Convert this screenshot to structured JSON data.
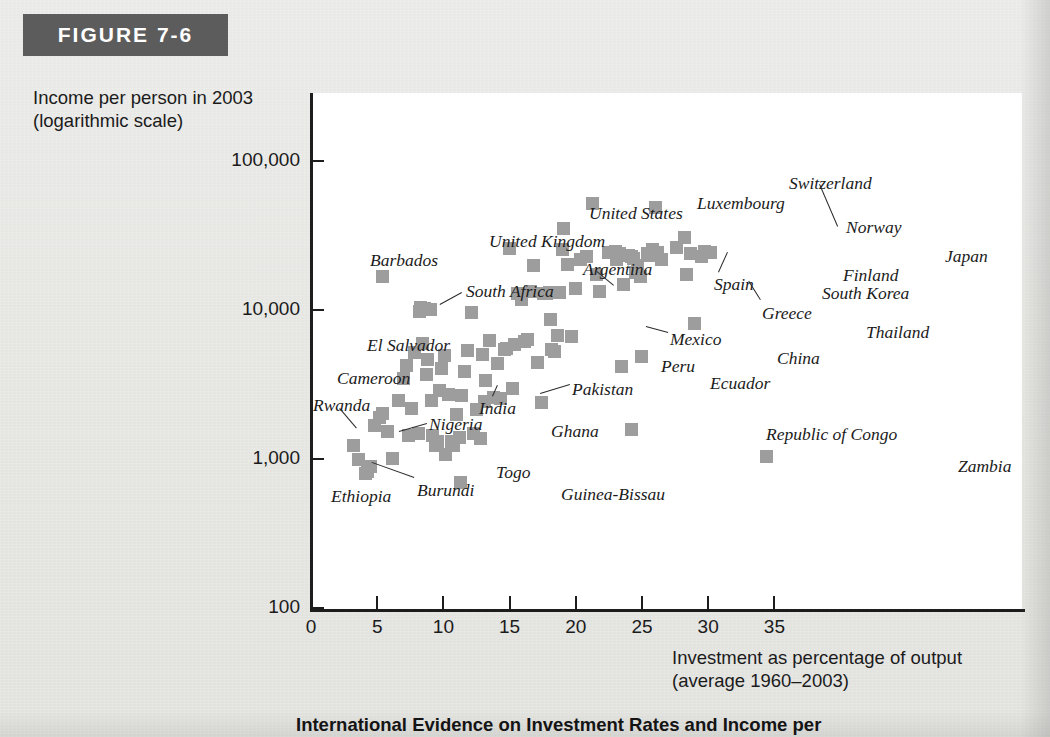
{
  "figure": {
    "label": "FIGURE 7-6",
    "caption": "International Evidence on Investment Rates and Income per"
  },
  "chart_data": {
    "type": "scatter",
    "title": "",
    "xlabel": "Investment as percentage of output\n(average 1960–2003)",
    "ylabel": "Income per person in 2003\n(logarithmic scale)",
    "xlabel_line1": "Investment as percentage of output",
    "xlabel_line2": "(average 1960–2003)",
    "ylabel_line1": "Income per person in 2003",
    "ylabel_line2": "(logarithmic scale)",
    "xlim": [
      0,
      38.5
    ],
    "ylim": [
      100,
      200000
    ],
    "yscale": "log",
    "grid": false,
    "legend": "none",
    "xticks": [
      0,
      5,
      10,
      15,
      20,
      25,
      30,
      35
    ],
    "xticklabels": [
      "0",
      "5",
      "10",
      "15",
      "20",
      "25",
      "30",
      "35"
    ],
    "yticks": [
      100,
      1000,
      10000,
      100000
    ],
    "yticklabels": [
      "100",
      "1,000",
      "10,000",
      "100,000"
    ],
    "marker": "square",
    "marker_color": "#9d9d9d",
    "labeled_points": [
      {
        "name": "Barbados",
        "x": 5.2,
        "y": 17000
      },
      {
        "name": "South Africa",
        "x": 8.4,
        "y": 10300
      },
      {
        "name": "El Salvador",
        "x": 8.6,
        "y": 4700
      },
      {
        "name": "Cameroon",
        "x": 5.2,
        "y": 2050
      },
      {
        "name": "Rwanda",
        "x": 3.0,
        "y": 1250
      },
      {
        "name": "Ethiopia",
        "x": 3.9,
        "y": 800
      },
      {
        "name": "Burundi",
        "x": 4.1,
        "y": 830
      },
      {
        "name": "Nigeria",
        "x": 7.2,
        "y": 1450
      },
      {
        "name": "India",
        "x": 10.2,
        "y": 2750
      },
      {
        "name": "Togo",
        "x": 10.0,
        "y": 1080
      },
      {
        "name": "Ghana",
        "x": 12.3,
        "y": 2150
      },
      {
        "name": "Guinea-Bissau",
        "x": 11.1,
        "y": 700
      },
      {
        "name": "Pakistan",
        "x": 12.9,
        "y": 2450
      },
      {
        "name": "United Kingdom",
        "x": 14.8,
        "y": 26000
      },
      {
        "name": "Argentina",
        "x": 15.7,
        "y": 11800
      },
      {
        "name": "United States",
        "x": 18.9,
        "y": 35500
      },
      {
        "name": "Mexico",
        "x": 17.9,
        "y": 8700
      },
      {
        "name": "Peru",
        "x": 18.2,
        "y": 5300
      },
      {
        "name": "Luxembourg",
        "x": 21.1,
        "y": 52000
      },
      {
        "name": "Spain",
        "x": 22.9,
        "y": 22000
      },
      {
        "name": "Greece",
        "x": 24.3,
        "y": 18000
      },
      {
        "name": "Ecuador",
        "x": 23.3,
        "y": 4200
      },
      {
        "name": "China",
        "x": 24.8,
        "y": 4900
      },
      {
        "name": "Switzerland",
        "x": 25.8,
        "y": 49000
      },
      {
        "name": "Norway",
        "x": 28.0,
        "y": 31000
      },
      {
        "name": "Japan",
        "x": 29.5,
        "y": 25000
      },
      {
        "name": "Finland",
        "x": 28.5,
        "y": 24000
      },
      {
        "name": "South Korea",
        "x": 28.2,
        "y": 17500
      },
      {
        "name": "Thailand",
        "x": 28.8,
        "y": 8200
      },
      {
        "name": "Republic of Congo",
        "x": 24.0,
        "y": 1600
      },
      {
        "name": "Zambia",
        "x": 34.2,
        "y": 1050
      }
    ],
    "point_count_total": 96
  }
}
